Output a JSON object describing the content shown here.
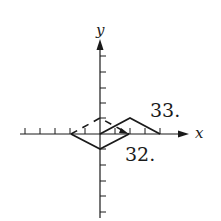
{
  "diagram": {
    "axes": {
      "x_label": "x",
      "y_label": "y",
      "origin_px": [
        100,
        134
      ],
      "unit_px": 15,
      "x_ticks": [
        -5,
        -4,
        -3,
        -2,
        -1,
        1,
        2,
        3,
        4
      ],
      "y_ticks": [
        -5,
        -4,
        -3,
        -2,
        -1,
        1,
        2,
        3,
        4,
        5
      ]
    },
    "figures": [
      {
        "label": "32.",
        "style": "solid",
        "points": [
          [
            -2,
            0
          ],
          [
            0,
            -1
          ],
          [
            2,
            0
          ]
        ]
      },
      {
        "label": "33.",
        "style": "solid",
        "points": [
          [
            0,
            0
          ],
          [
            2,
            1
          ],
          [
            4,
            0
          ]
        ]
      },
      {
        "label": "",
        "style": "dashed",
        "points": [
          [
            -2,
            0
          ],
          [
            0,
            1
          ],
          [
            2,
            0
          ]
        ]
      }
    ],
    "labels": {
      "fig32": "32.",
      "fig33": "33."
    },
    "colors": {
      "stroke": "#1a1a1a",
      "background": "#ffffff"
    }
  }
}
